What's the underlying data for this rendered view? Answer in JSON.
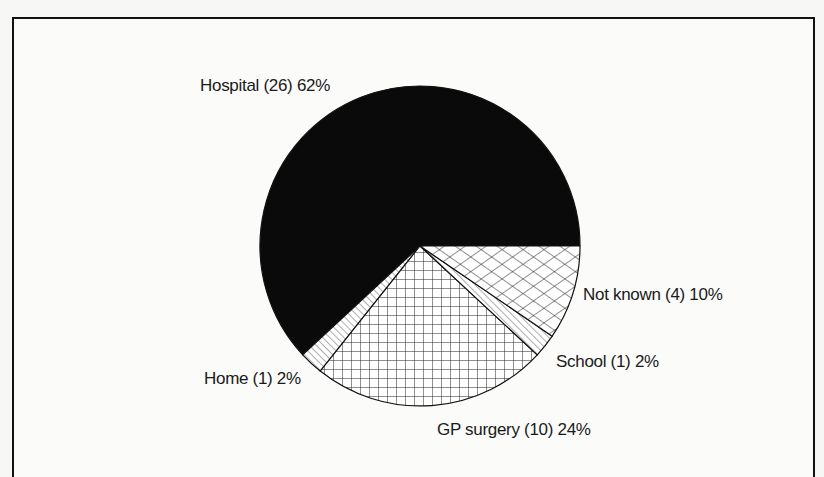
{
  "chart_data": {
    "type": "pie",
    "title": "",
    "categories": [
      "Hospital",
      "Home",
      "GP surgery",
      "School",
      "Not known"
    ],
    "values": [
      26,
      1,
      10,
      1,
      4
    ],
    "percentages": [
      62,
      2,
      24,
      2,
      10
    ],
    "labels": [
      "Hospital (26) 62%",
      "Home (1) 2%",
      "GP surgery (10) 24%",
      "School (1) 2%",
      "Not known (4) 10%"
    ],
    "fills": [
      "solid-black",
      "diagonal-lines",
      "square-grid",
      "diagonal-lines",
      "diagonal-crosshatch"
    ],
    "start_angle_deg": 0,
    "direction": "counterclockwise",
    "legend": "none (direct labels)"
  },
  "labels": {
    "hospital": "Hospital (26) 62%",
    "home": "Home (1) 2%",
    "gp": "GP surgery (10) 24%",
    "school": "School (1) 2%",
    "notknown": "Not known (4) 10%"
  }
}
